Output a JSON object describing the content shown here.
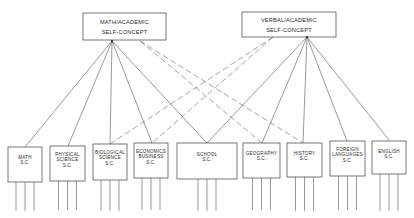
{
  "diagram": {
    "top_factors": [
      {
        "id": "math",
        "line1": "MATH/ACADEMIC",
        "line2": "SELF-CONCEPT",
        "x": 83,
        "y": 13,
        "w": 83,
        "h": 27,
        "origin": [
          112,
          41
        ],
        "dash_origin": [
          140,
          41
        ]
      },
      {
        "id": "verbal",
        "line1": "VERBAL/ACADEMIC",
        "line2": "SELF-CONCEPT",
        "x": 242,
        "y": 12,
        "w": 94,
        "h": 25,
        "origin": [
          307,
          37
        ],
        "dash_origin": [
          273,
          37
        ]
      }
    ],
    "subject_factors": [
      {
        "id": "math-sc",
        "lines": [
          "MATH",
          "S.C."
        ],
        "x": 8,
        "y": 147,
        "w": 34,
        "h": 35,
        "top": [
          25,
          147
        ]
      },
      {
        "id": "physical-science-sc",
        "lines": [
          "PHYSICAL",
          "SCIENCE",
          "S.C."
        ],
        "x": 50,
        "y": 146,
        "w": 35,
        "h": 35,
        "top": [
          68,
          146
        ]
      },
      {
        "id": "biological-science-sc",
        "lines": [
          "BIOLOGICAL",
          "SCIENCE",
          "S.C."
        ],
        "x": 93,
        "y": 144,
        "w": 34,
        "h": 36,
        "top": [
          110,
          144
        ]
      },
      {
        "id": "economics-business-sc",
        "lines": [
          "ECONOMICS",
          "BUSINESS",
          "S.C."
        ],
        "x": 134,
        "y": 143,
        "w": 34,
        "h": 35,
        "top": [
          152,
          143
        ]
      },
      {
        "id": "school-sc",
        "lines": [
          "SCHOOL",
          "S.C."
        ],
        "x": 177,
        "y": 143,
        "w": 60,
        "h": 36,
        "top": [
          207,
          143
        ]
      },
      {
        "id": "geography-sc",
        "lines": [
          "GEOGRAPHY",
          "S.C."
        ],
        "x": 243,
        "y": 143,
        "w": 37,
        "h": 35,
        "top": [
          262,
          143
        ]
      },
      {
        "id": "history-sc",
        "lines": [
          "HISTORY",
          "S.C."
        ],
        "x": 287,
        "y": 143,
        "w": 35,
        "h": 34,
        "top": [
          303,
          143
        ]
      },
      {
        "id": "foreign-languages-sc",
        "lines": [
          "FOREIGN",
          "LANGUAGES",
          "S.C."
        ],
        "x": 330,
        "y": 141,
        "w": 35,
        "h": 35,
        "top": [
          347,
          141
        ]
      },
      {
        "id": "english-sc",
        "lines": [
          "ENGLISH",
          "S.C."
        ],
        "x": 372,
        "y": 141,
        "w": 34,
        "h": 33,
        "top": [
          389,
          140
        ]
      }
    ],
    "solid_links": {
      "math": [
        "math-sc",
        "physical-science-sc",
        "biological-science-sc",
        "economics-business-sc",
        "school-sc"
      ],
      "verbal": [
        "school-sc",
        "geography-sc",
        "history-sc",
        "foreign-languages-sc",
        "english-sc"
      ]
    },
    "dashed_links": {
      "math": [
        "geography-sc",
        "history-sc"
      ],
      "verbal": [
        "biological-science-sc",
        "economics-business-sc"
      ]
    },
    "indicator_bottom_y": 211,
    "colors": {
      "line": "#555555",
      "text": "#2a2a2a",
      "background": "#ffffff"
    }
  }
}
